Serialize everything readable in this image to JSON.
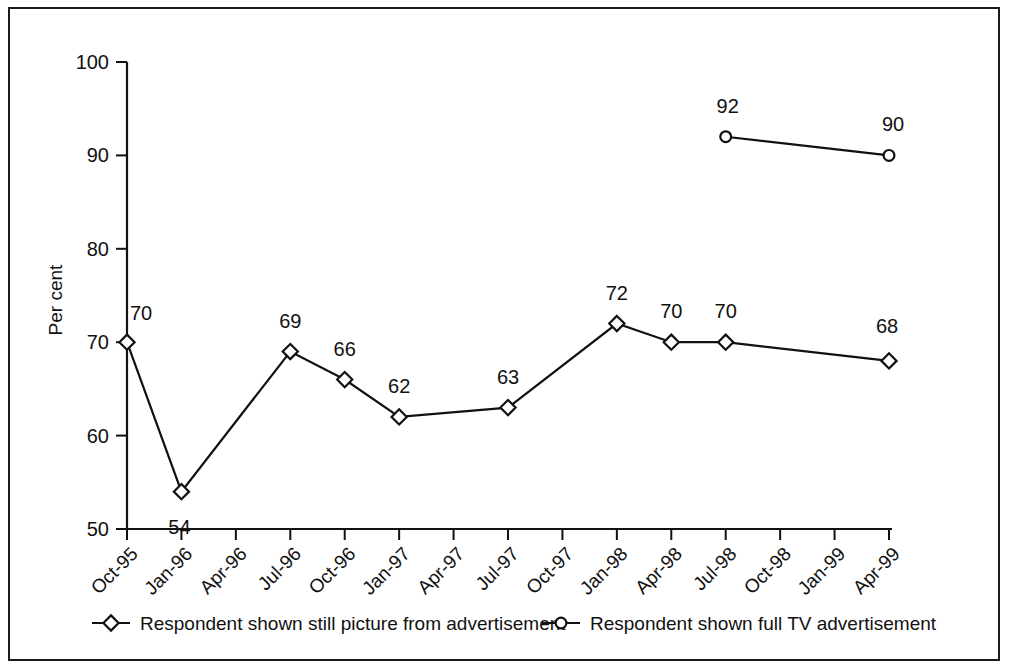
{
  "chart_data": {
    "type": "line",
    "title": "",
    "xlabel": "",
    "ylabel": "Per cent",
    "ylim": [
      50,
      100
    ],
    "ytick_step": 10,
    "yticks": [
      "50",
      "60",
      "70",
      "80",
      "90",
      "100"
    ],
    "grid": false,
    "legend_position": "bottom",
    "categories": [
      "Oct-95",
      "Jan-96",
      "Apr-96",
      "Jul-96",
      "Oct-96",
      "Jan-97",
      "Apr-97",
      "Jul-97",
      "Oct-97",
      "Jan-98",
      "Apr-98",
      "Jul-98",
      "Oct-98",
      "Jan-99",
      "Apr-99"
    ],
    "series": [
      {
        "name": "Respondent shown still picture from advertisement",
        "marker": "diamond",
        "values": [
          70,
          54,
          null,
          69,
          66,
          62,
          null,
          63,
          null,
          72,
          70,
          70,
          null,
          null,
          68
        ],
        "labels": [
          "70",
          "54",
          "",
          "69",
          "66",
          "62",
          "",
          "63",
          "",
          "72",
          "70",
          "70",
          "",
          "",
          "68"
        ]
      },
      {
        "name": "Respondent shown full TV advertisement",
        "marker": "circle",
        "values": [
          null,
          null,
          null,
          null,
          null,
          null,
          null,
          null,
          null,
          null,
          null,
          92,
          null,
          null,
          90
        ],
        "labels": [
          "",
          "",
          "",
          "",
          "",
          "",
          "",
          "",
          "",
          "",
          "",
          "92",
          "",
          "",
          "90"
        ]
      }
    ],
    "colors": {
      "line": "#111111",
      "marker_fill": "#ffffff",
      "frame": "#1a1a1a"
    }
  },
  "legend": {
    "items": [
      {
        "label": "Respondent shown still picture from advertisement",
        "marker": "diamond"
      },
      {
        "label": "Respondent shown full TV advertisement",
        "marker": "circle"
      }
    ]
  }
}
